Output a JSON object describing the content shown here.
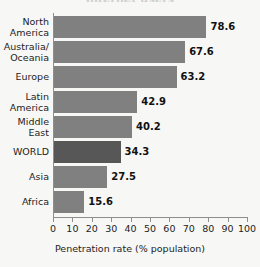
{
  "chart_data": {
    "type": "bar",
    "orientation": "horizontal",
    "title": "",
    "xlabel": "Penetration rate (% population)",
    "ylabel": "",
    "xlim": [
      0,
      100
    ],
    "xticks": [
      0,
      10,
      20,
      30,
      40,
      50,
      60,
      70,
      80,
      90,
      100
    ],
    "xtick_labels": [
      "0",
      "10",
      "20",
      "30",
      "40",
      "50",
      "60",
      "70",
      "80",
      "90",
      "100"
    ],
    "grid": false,
    "legend": null,
    "categories": [
      "North\nAmerica",
      "Australia/\nOceania",
      "Europe",
      "Latin\nAmerica",
      "Middle\nEast",
      "WORLD",
      "Asia",
      "Africa"
    ],
    "values": [
      78.6,
      67.6,
      63.2,
      42.9,
      40.2,
      34.3,
      27.5,
      15.6
    ],
    "value_labels": [
      "78.6",
      "67.6",
      "63.2",
      "42.9",
      "40.2",
      "34.3",
      "27.5",
      "15.6"
    ],
    "highlight_category": "WORLD",
    "colors": {
      "bar": "#808080",
      "bar_highlight": "#575757",
      "axis": "#8e8e8e",
      "text": "#1d1d1d",
      "background": "#f7f7f5"
    }
  },
  "axis": {
    "x_title": "Penetration rate (% population)"
  },
  "title_remnant": "Internet users"
}
